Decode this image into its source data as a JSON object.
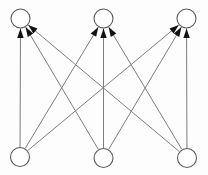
{
  "figure": {
    "title": "Bipartite directed graph",
    "background_color": "#fdfdfd",
    "edge_color": "#7d7d7d",
    "node_stroke_color": "#5a5a5a",
    "node_fill_color": "#ffffff",
    "arrow_color": "#121212",
    "edge_count": 9,
    "node_count": 6
  },
  "chart_data": {
    "type": "diagram",
    "title": "",
    "layout": "bipartite",
    "nodes": [
      {
        "id": "t1",
        "label": "",
        "layer": "top",
        "cx": 20.5,
        "cy": 18.5,
        "r": 9.5
      },
      {
        "id": "t2",
        "label": "",
        "layer": "top",
        "cx": 103.5,
        "cy": 18.5,
        "r": 9.5
      },
      {
        "id": "t3",
        "label": "",
        "layer": "top",
        "cx": 186.5,
        "cy": 18.5,
        "r": 9.5
      },
      {
        "id": "b1",
        "label": "",
        "layer": "bottom",
        "cx": 20.0,
        "cy": 157.0,
        "r": 9.5
      },
      {
        "id": "b2",
        "label": "",
        "layer": "bottom",
        "cx": 103.5,
        "cy": 158.0,
        "r": 9.5
      },
      {
        "id": "b3",
        "label": "",
        "layer": "bottom",
        "cx": 187.0,
        "cy": 158.0,
        "r": 9.5
      }
    ],
    "edges": [
      {
        "from": "b1",
        "to": "t1",
        "directed": true
      },
      {
        "from": "b1",
        "to": "t2",
        "directed": true
      },
      {
        "from": "b1",
        "to": "t3",
        "directed": true
      },
      {
        "from": "b2",
        "to": "t1",
        "directed": true
      },
      {
        "from": "b2",
        "to": "t2",
        "directed": true
      },
      {
        "from": "b2",
        "to": "t3",
        "directed": true
      },
      {
        "from": "b3",
        "to": "t1",
        "directed": true
      },
      {
        "from": "b3",
        "to": "t2",
        "directed": true
      },
      {
        "from": "b3",
        "to": "t3",
        "directed": true
      }
    ]
  }
}
